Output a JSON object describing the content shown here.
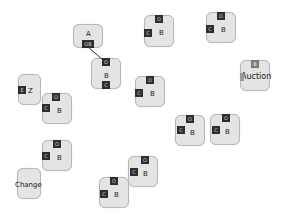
{
  "diagram": {
    "type": "node-graph",
    "nodes": [
      {
        "id": "n1",
        "title": "A",
        "x": 73,
        "y": 24,
        "w": 30,
        "h": 24,
        "ports": [
          {
            "label": "OB",
            "side": "bottom",
            "x": 82,
            "y": 40
          }
        ]
      },
      {
        "id": "n2",
        "title": "B",
        "x": 91,
        "y": 58,
        "w": 30,
        "h": 31,
        "ports": [
          {
            "label": "O",
            "side": "top",
            "x": 102,
            "y": 58
          },
          {
            "label": "C",
            "side": "bottom",
            "x": 102,
            "y": 81
          }
        ]
      },
      {
        "id": "n3",
        "title": "B",
        "x": 144,
        "y": 15,
        "w": 30,
        "h": 32,
        "ports": [
          {
            "label": "O",
            "side": "top",
            "x": 155,
            "y": 15
          },
          {
            "label": "C",
            "side": "left",
            "x": 144,
            "y": 29
          }
        ]
      },
      {
        "id": "n4",
        "title": "B",
        "x": 206,
        "y": 12,
        "w": 30,
        "h": 31,
        "ports": [
          {
            "label": "O",
            "side": "top",
            "x": 217,
            "y": 12
          },
          {
            "label": "C",
            "side": "left",
            "x": 206,
            "y": 25
          }
        ]
      },
      {
        "id": "n5",
        "title": "Z",
        "x": 18,
        "y": 74,
        "w": 23,
        "h": 31,
        "ports": [
          {
            "label": "E",
            "side": "left",
            "x": 18,
            "y": 86
          }
        ]
      },
      {
        "id": "n6",
        "title": "B",
        "x": 42,
        "y": 93,
        "w": 30,
        "h": 31,
        "ports": [
          {
            "label": "O",
            "side": "top",
            "x": 52,
            "y": 93
          },
          {
            "label": "C",
            "side": "left",
            "x": 42,
            "y": 104
          }
        ]
      },
      {
        "id": "n7",
        "title": "B",
        "x": 135,
        "y": 76,
        "w": 30,
        "h": 31,
        "ports": [
          {
            "label": "O",
            "side": "top",
            "x": 146,
            "y": 76
          },
          {
            "label": "C",
            "side": "left",
            "x": 135,
            "y": 89
          }
        ]
      },
      {
        "id": "n8",
        "title": "Auction",
        "x": 240,
        "y": 60,
        "w": 30,
        "h": 31,
        "ports": [
          {
            "label": "B",
            "side": "top",
            "x": 251,
            "y": 60
          },
          {
            "label": "",
            "side": "left",
            "x": 240,
            "y": 73
          }
        ]
      },
      {
        "id": "n9",
        "title": "B",
        "x": 175,
        "y": 115,
        "w": 30,
        "h": 31,
        "ports": [
          {
            "label": "O",
            "side": "top",
            "x": 186,
            "y": 115
          },
          {
            "label": "C",
            "side": "left",
            "x": 177,
            "y": 126
          }
        ]
      },
      {
        "id": "n10",
        "title": "B",
        "x": 210,
        "y": 114,
        "w": 30,
        "h": 31,
        "ports": [
          {
            "label": "O",
            "side": "top",
            "x": 222,
            "y": 114
          },
          {
            "label": "C",
            "side": "left",
            "x": 212,
            "y": 126
          }
        ]
      },
      {
        "id": "n11",
        "title": "B",
        "x": 42,
        "y": 140,
        "w": 30,
        "h": 31,
        "ports": [
          {
            "label": "O",
            "side": "top",
            "x": 53,
            "y": 140
          },
          {
            "label": "C",
            "side": "left",
            "x": 42,
            "y": 152
          }
        ]
      },
      {
        "id": "n12",
        "title": "Change",
        "x": 17,
        "y": 168,
        "w": 24,
        "h": 31,
        "ports": []
      },
      {
        "id": "n13",
        "title": "B",
        "x": 128,
        "y": 156,
        "w": 30,
        "h": 31,
        "ports": [
          {
            "label": "O",
            "side": "top",
            "x": 141,
            "y": 156
          },
          {
            "label": "C",
            "side": "left",
            "x": 130,
            "y": 168
          }
        ]
      },
      {
        "id": "n14",
        "title": "B",
        "x": 99,
        "y": 177,
        "w": 30,
        "h": 31,
        "ports": [
          {
            "label": "O",
            "side": "top",
            "x": 110,
            "y": 177
          },
          {
            "label": "C",
            "side": "left",
            "x": 100,
            "y": 190
          }
        ]
      }
    ],
    "edges": [
      {
        "from": "n1.OB",
        "to": "n2.O",
        "x1": 88,
        "y1": 47,
        "x2": 103,
        "y2": 60
      }
    ]
  }
}
